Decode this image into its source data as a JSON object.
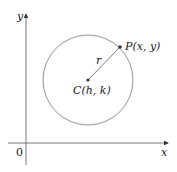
{
  "diagram": {
    "axes": {
      "x_label": "x",
      "y_label": "y",
      "origin_label": "0"
    },
    "circle": {
      "center_label": "C(h, k)",
      "point_label": "P(x, y)",
      "radius_label": "r"
    },
    "colors": {
      "line": "#555555",
      "text": "#222222",
      "background": "#ffffff"
    }
  }
}
